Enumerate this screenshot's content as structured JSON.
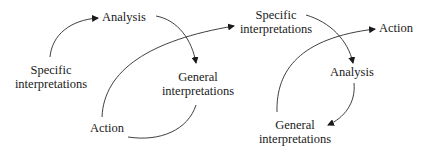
{
  "diagrams": [
    {
      "name": "cycle-1",
      "nodes": {
        "specific": [
          "Specific",
          "interpretations"
        ],
        "analysis": [
          "Analysis"
        ],
        "general": [
          "General",
          "interpretations"
        ],
        "action": [
          "Action"
        ]
      }
    },
    {
      "name": "cycle-2",
      "nodes": {
        "specific": [
          "Specific",
          "interpretations"
        ],
        "analysis": [
          "Analysis"
        ],
        "general": [
          "General",
          "interpretations"
        ],
        "action": [
          "Action"
        ]
      }
    }
  ],
  "edges": [
    {
      "from": "Specific interpretations",
      "to": "Analysis",
      "cycle": 1
    },
    {
      "from": "Analysis",
      "to": "General interpretations",
      "cycle": 1
    },
    {
      "from": "General interpretations",
      "to": "Action",
      "cycle": 1
    },
    {
      "from": "Action",
      "to": "Specific interpretations",
      "cycle": "1→2"
    },
    {
      "from": "Specific interpretations",
      "to": "Analysis",
      "cycle": 2
    },
    {
      "from": "Analysis",
      "to": "General interpretations",
      "cycle": 2
    },
    {
      "from": "General interpretations",
      "to": "Action",
      "cycle": 2
    }
  ],
  "colors": {
    "line": "#2a2a2a",
    "text": "#1a1a1a"
  }
}
